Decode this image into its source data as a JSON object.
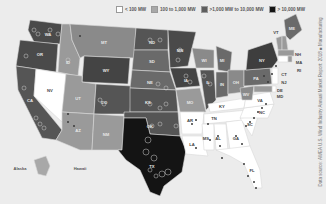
{
  "legend": {
    "items": [
      {
        "label": "< 100 MW",
        "color": "#ffffff"
      },
      {
        "label": "100 to 1,000 MW",
        "color": "#a8a8a8"
      },
      {
        "label": ">1,000 MW to 10,000 MW",
        "color": "#5e5e5e"
      },
      {
        "label": "> 10,000 MW",
        "color": "#141414"
      }
    ]
  },
  "source_note": "Data source: AWEA U.S. Wind Industry Annual Market Report: 2018  ■ Manufacturing",
  "insets": {
    "alaska": "Alaska",
    "hawaii": "Hawaii"
  },
  "states": {
    "WA": "WA",
    "OR": "OR",
    "CA": "CA",
    "NV": "NV",
    "ID": "ID",
    "MT": "MT",
    "WY": "WY",
    "UT": "UT",
    "AZ": "AZ",
    "CO": "CO",
    "NM": "NM",
    "ND": "ND",
    "SD": "SD",
    "NE": "NE",
    "KS": "KS",
    "OK": "OK",
    "TX": "TX",
    "MN": "MN",
    "IA": "IA",
    "MO": "MO",
    "AR": "AR",
    "LA": "LA",
    "WI": "WI",
    "IL": "IL",
    "MI": "MI",
    "IN": "IN",
    "OH": "OH",
    "KY": "KY",
    "TN": "TN",
    "MS": "MS",
    "AL": "AL",
    "GA": "GA",
    "FL": "FL",
    "SC": "SC",
    "NC": "NC",
    "VA": "VA",
    "WV": "WV",
    "PA": "PA",
    "NY": "NY",
    "VT": "VT",
    "NH": "NH",
    "ME": "ME",
    "MA": "MA",
    "RI": "RI",
    "CT": "CT",
    "NJ": "NJ",
    "DE": "DE",
    "MD": "MD"
  }
}
